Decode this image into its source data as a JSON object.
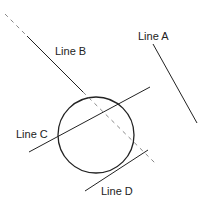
{
  "diagram": {
    "title": "",
    "colors": {
      "stroke": "#222222",
      "dashed": "#888888",
      "background": "#ffffff"
    },
    "circle": {
      "cx": 96,
      "cy": 135,
      "r": 38
    },
    "lines": [
      {
        "id": "A",
        "label": "Line A",
        "x1": 153,
        "y1": 44,
        "x2": 197,
        "y2": 123,
        "relation": "external (no intersection)",
        "label_pos": [
          138,
          40
        ]
      },
      {
        "id": "B",
        "label": "Line B",
        "segments": [
          {
            "style": "dashed",
            "x1": 5,
            "y1": 14,
            "x2": 27,
            "y2": 36
          },
          {
            "style": "solid",
            "x1": 27,
            "y1": 36,
            "x2": 83,
            "y2": 92
          },
          {
            "style": "dashed",
            "x1": 83,
            "y1": 92,
            "x2": 155,
            "y2": 163
          }
        ],
        "relation": "dashed through circle",
        "label_pos": [
          55,
          55
        ]
      },
      {
        "id": "C",
        "label": "Line C",
        "x1": 29,
        "y1": 152,
        "x2": 150,
        "y2": 87,
        "relation": "secant",
        "label_pos": [
          16,
          138
        ]
      },
      {
        "id": "D",
        "label": "Line D",
        "x1": 85,
        "y1": 191,
        "x2": 148,
        "y2": 150,
        "relation": "tangent",
        "label_pos": [
          101,
          195
        ]
      }
    ]
  }
}
